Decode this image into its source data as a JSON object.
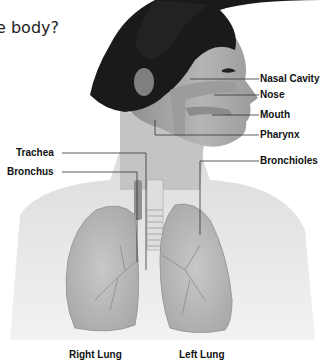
{
  "question": "e body?",
  "diagram": {
    "labels": {
      "nasal_cavity": "Nasal Cavity",
      "nose": "Nose",
      "mouth": "Mouth",
      "pharynx": "Pharynx",
      "bronchioles": "Bronchioles",
      "trachea": "Trachea",
      "bronchus": "Bronchus",
      "right_lung": "Right Lung",
      "left_lung": "Left Lung"
    }
  }
}
